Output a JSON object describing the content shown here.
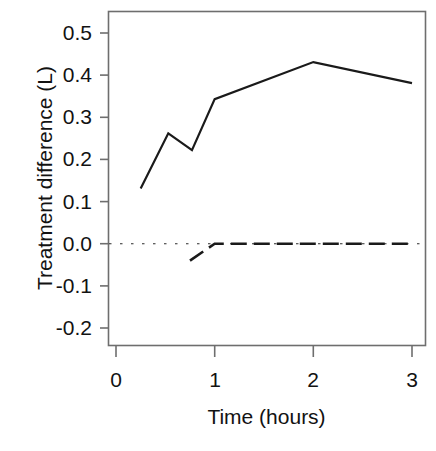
{
  "chart_data": {
    "type": "line",
    "title": "",
    "xlabel": "Time (hours)",
    "ylabel": "Treatment difference (L)",
    "xlim": [
      -0.08,
      3.13
    ],
    "ylim": [
      -0.236,
      0.533
    ],
    "xticks": [
      0,
      1,
      2,
      3
    ],
    "xtick_labels": [
      "0",
      "1",
      "2",
      "3"
    ],
    "yticks": [
      -0.2,
      -0.1,
      0.0,
      0.1,
      0.2,
      0.3,
      0.4,
      0.5
    ],
    "ytick_labels": [
      "-0.2",
      "-0.1",
      "0.0",
      "0.1",
      "0.2",
      "0.3",
      "0.4",
      "0.5"
    ],
    "grid": false,
    "legend": "none",
    "box_frame": true,
    "series": [
      {
        "name": "Treatment difference (solid)",
        "style": "solid",
        "linewidth": 2.2,
        "color": "#1a1a1a",
        "x": [
          0.25,
          0.53,
          0.77,
          1.0,
          2.0,
          3.0
        ],
        "values": [
          0.131,
          0.262,
          0.222,
          0.343,
          0.431,
          0.381
        ]
      },
      {
        "name": "Reference / comparator (dashed)",
        "style": "dashed",
        "linewidth": 2.6,
        "color": "#1a1a1a",
        "x": [
          0.75,
          1.0,
          2.0,
          3.0
        ],
        "values": [
          -0.04,
          0.0,
          0.0,
          0.0
        ]
      },
      {
        "name": "Zero reference line (dotted)",
        "style": "dotted",
        "linewidth": 1.1,
        "color": "#2b2b2b",
        "x": [
          -0.08,
          3.13
        ],
        "values": [
          0.0,
          0.0
        ]
      }
    ]
  },
  "axes": {
    "y_tick_labels": [
      "0.5",
      "0.4",
      "0.3",
      "0.2",
      "0.1",
      "0.0",
      "-0.1",
      "-0.2"
    ],
    "x_tick_labels": [
      "0",
      "1",
      "2",
      "3"
    ],
    "y_axis_title": "Treatment difference (L)",
    "x_axis_title": "Time (hours)"
  },
  "colors": {
    "line": "#1a1a1a",
    "frame": "#6e6e6e",
    "text": "#121212",
    "background": "#ffffff"
  }
}
